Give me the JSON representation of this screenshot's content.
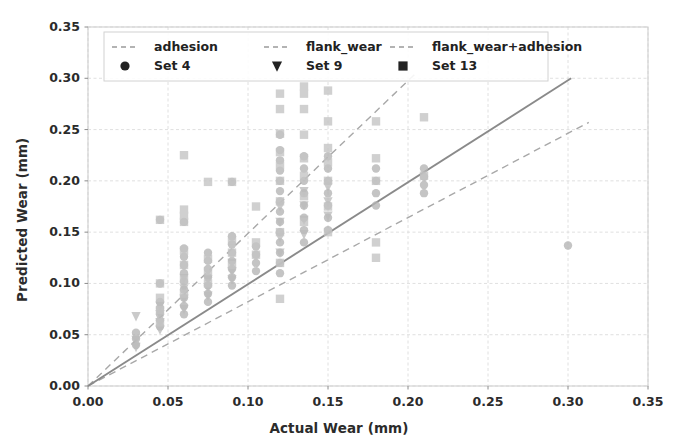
{
  "chart_data": {
    "type": "scatter",
    "title": "",
    "xlabel": "Actual Wear (mm)",
    "ylabel": "Predicted Wear (mm)",
    "xlim": [
      0.0,
      0.35
    ],
    "ylim": [
      0.0,
      0.35
    ],
    "xticks": [
      "0.00",
      "0.05",
      "0.10",
      "0.15",
      "0.20",
      "0.25",
      "0.30",
      "0.35"
    ],
    "yticks": [
      "0.00",
      "0.05",
      "0.10",
      "0.15",
      "0.20",
      "0.25",
      "0.30",
      "0.35"
    ],
    "xtick_values": [
      0.0,
      0.05,
      0.1,
      0.15,
      0.2,
      0.25,
      0.3,
      0.35
    ],
    "ytick_values": [
      0.0,
      0.05,
      0.1,
      0.15,
      0.2,
      0.25,
      0.3,
      0.35
    ],
    "grid": true,
    "legend_position": "upper left",
    "legend_entries": [
      {
        "label": "adhesion",
        "kind": "line",
        "style": "dashed",
        "color": "#9a9a9a"
      },
      {
        "label": "flank_wear",
        "kind": "line",
        "style": "dashed",
        "color": "#9a9a9a"
      },
      {
        "label": "flank_wear+adhesion",
        "kind": "line",
        "style": "dashed",
        "color": "#9a9a9a"
      },
      {
        "label": "Set 4",
        "kind": "marker",
        "marker": "circle",
        "color": "#222222"
      },
      {
        "label": "Set 9",
        "kind": "marker",
        "marker": "triangle-down",
        "color": "#222222"
      },
      {
        "label": "Set 13",
        "kind": "marker",
        "marker": "square",
        "color": "#222222"
      }
    ],
    "lines": [
      {
        "name": "adhesion",
        "style": "dashed",
        "color": "#a8a8a8",
        "x": [
          0.0,
          0.205
        ],
        "y": [
          0.0,
          0.305
        ]
      },
      {
        "name": "flank_wear",
        "style": "dashed",
        "color": "#a8a8a8",
        "x": [
          0.0,
          0.313
        ],
        "y": [
          0.0,
          0.257
        ]
      },
      {
        "name": "flank_wear+adhesion",
        "style": "solid",
        "color": "#8a8a8a",
        "x": [
          0.0,
          0.302
        ],
        "y": [
          0.0,
          0.3
        ]
      }
    ],
    "series": [
      {
        "name": "Set 4",
        "marker": "circle",
        "color": "#b4b4b4",
        "points": [
          [
            0.03,
            0.04
          ],
          [
            0.03,
            0.046
          ],
          [
            0.03,
            0.052
          ],
          [
            0.045,
            0.058
          ],
          [
            0.045,
            0.064
          ],
          [
            0.045,
            0.07
          ],
          [
            0.045,
            0.076
          ],
          [
            0.045,
            0.082
          ],
          [
            0.045,
            0.1
          ],
          [
            0.045,
            0.162
          ],
          [
            0.06,
            0.07
          ],
          [
            0.06,
            0.078
          ],
          [
            0.06,
            0.086
          ],
          [
            0.06,
            0.094
          ],
          [
            0.06,
            0.102
          ],
          [
            0.06,
            0.11
          ],
          [
            0.06,
            0.118
          ],
          [
            0.06,
            0.126
          ],
          [
            0.06,
            0.134
          ],
          [
            0.06,
            0.16
          ],
          [
            0.075,
            0.082
          ],
          [
            0.075,
            0.09
          ],
          [
            0.075,
            0.098
          ],
          [
            0.075,
            0.106
          ],
          [
            0.075,
            0.114
          ],
          [
            0.075,
            0.122
          ],
          [
            0.075,
            0.13
          ],
          [
            0.09,
            0.098
          ],
          [
            0.09,
            0.106
          ],
          [
            0.09,
            0.114
          ],
          [
            0.09,
            0.122
          ],
          [
            0.09,
            0.13
          ],
          [
            0.09,
            0.138
          ],
          [
            0.09,
            0.146
          ],
          [
            0.09,
            0.199
          ],
          [
            0.105,
            0.112
          ],
          [
            0.105,
            0.12
          ],
          [
            0.105,
            0.128
          ],
          [
            0.105,
            0.136
          ],
          [
            0.12,
            0.11
          ],
          [
            0.12,
            0.12
          ],
          [
            0.12,
            0.13
          ],
          [
            0.12,
            0.14
          ],
          [
            0.12,
            0.15
          ],
          [
            0.12,
            0.16
          ],
          [
            0.12,
            0.17
          ],
          [
            0.12,
            0.18
          ],
          [
            0.12,
            0.19
          ],
          [
            0.12,
            0.2
          ],
          [
            0.12,
            0.21
          ],
          [
            0.12,
            0.22
          ],
          [
            0.12,
            0.23
          ],
          [
            0.12,
            0.245
          ],
          [
            0.135,
            0.14
          ],
          [
            0.135,
            0.152
          ],
          [
            0.135,
            0.164
          ],
          [
            0.135,
            0.176
          ],
          [
            0.135,
            0.188
          ],
          [
            0.135,
            0.2
          ],
          [
            0.135,
            0.212
          ],
          [
            0.135,
            0.224
          ],
          [
            0.15,
            0.152
          ],
          [
            0.15,
            0.164
          ],
          [
            0.15,
            0.176
          ],
          [
            0.15,
            0.188
          ],
          [
            0.15,
            0.2
          ],
          [
            0.15,
            0.212
          ],
          [
            0.15,
            0.224
          ],
          [
            0.18,
            0.176
          ],
          [
            0.18,
            0.188
          ],
          [
            0.18,
            0.2
          ],
          [
            0.18,
            0.212
          ],
          [
            0.21,
            0.188
          ],
          [
            0.21,
            0.196
          ],
          [
            0.21,
            0.204
          ],
          [
            0.21,
            0.212
          ],
          [
            0.3,
            0.137
          ]
        ]
      },
      {
        "name": "Set 9",
        "marker": "triangle-down",
        "color": "#bcbcbc",
        "points": [
          [
            0.03,
            0.068
          ],
          [
            0.03,
            0.045
          ],
          [
            0.03,
            0.038
          ],
          [
            0.045,
            0.055
          ],
          [
            0.045,
            0.062
          ],
          [
            0.045,
            0.07
          ],
          [
            0.045,
            0.078
          ],
          [
            0.06,
            0.075
          ],
          [
            0.06,
            0.085
          ],
          [
            0.06,
            0.095
          ],
          [
            0.06,
            0.105
          ],
          [
            0.075,
            0.088
          ],
          [
            0.075,
            0.096
          ],
          [
            0.075,
            0.104
          ],
          [
            0.09,
            0.104
          ],
          [
            0.09,
            0.112
          ],
          [
            0.09,
            0.12
          ],
          [
            0.12,
            0.13
          ],
          [
            0.12,
            0.145
          ],
          [
            0.12,
            0.16
          ],
          [
            0.12,
            0.175
          ],
          [
            0.135,
            0.148
          ],
          [
            0.135,
            0.162
          ],
          [
            0.135,
            0.176
          ],
          [
            0.135,
            0.19
          ],
          [
            0.15,
            0.166
          ],
          [
            0.15,
            0.18
          ],
          [
            0.15,
            0.194
          ]
        ]
      },
      {
        "name": "Set 13",
        "marker": "square",
        "color": "#c4c4c4",
        "points": [
          [
            0.045,
            0.062
          ],
          [
            0.045,
            0.074
          ],
          [
            0.045,
            0.086
          ],
          [
            0.045,
            0.1
          ],
          [
            0.045,
            0.162
          ],
          [
            0.06,
            0.09
          ],
          [
            0.06,
            0.104
          ],
          [
            0.06,
            0.118
          ],
          [
            0.06,
            0.132
          ],
          [
            0.06,
            0.16
          ],
          [
            0.06,
            0.166
          ],
          [
            0.06,
            0.172
          ],
          [
            0.06,
            0.225
          ],
          [
            0.075,
            0.1
          ],
          [
            0.075,
            0.112
          ],
          [
            0.075,
            0.124
          ],
          [
            0.075,
            0.199
          ],
          [
            0.09,
            0.118
          ],
          [
            0.09,
            0.13
          ],
          [
            0.09,
            0.142
          ],
          [
            0.09,
            0.199
          ],
          [
            0.105,
            0.128
          ],
          [
            0.105,
            0.14
          ],
          [
            0.105,
            0.175
          ],
          [
            0.12,
            0.085
          ],
          [
            0.12,
            0.12
          ],
          [
            0.12,
            0.15
          ],
          [
            0.12,
            0.18
          ],
          [
            0.12,
            0.2
          ],
          [
            0.12,
            0.215
          ],
          [
            0.12,
            0.228
          ],
          [
            0.12,
            0.246
          ],
          [
            0.12,
            0.27
          ],
          [
            0.12,
            0.285
          ],
          [
            0.135,
            0.16
          ],
          [
            0.135,
            0.185
          ],
          [
            0.135,
            0.205
          ],
          [
            0.135,
            0.222
          ],
          [
            0.135,
            0.245
          ],
          [
            0.135,
            0.27
          ],
          [
            0.135,
            0.285
          ],
          [
            0.135,
            0.292
          ],
          [
            0.15,
            0.15
          ],
          [
            0.15,
            0.175
          ],
          [
            0.15,
            0.2
          ],
          [
            0.15,
            0.218
          ],
          [
            0.15,
            0.232
          ],
          [
            0.15,
            0.258
          ],
          [
            0.15,
            0.288
          ],
          [
            0.18,
            0.125
          ],
          [
            0.18,
            0.14
          ],
          [
            0.18,
            0.2
          ],
          [
            0.18,
            0.222
          ],
          [
            0.18,
            0.258
          ],
          [
            0.21,
            0.205
          ],
          [
            0.21,
            0.262
          ]
        ]
      }
    ]
  }
}
